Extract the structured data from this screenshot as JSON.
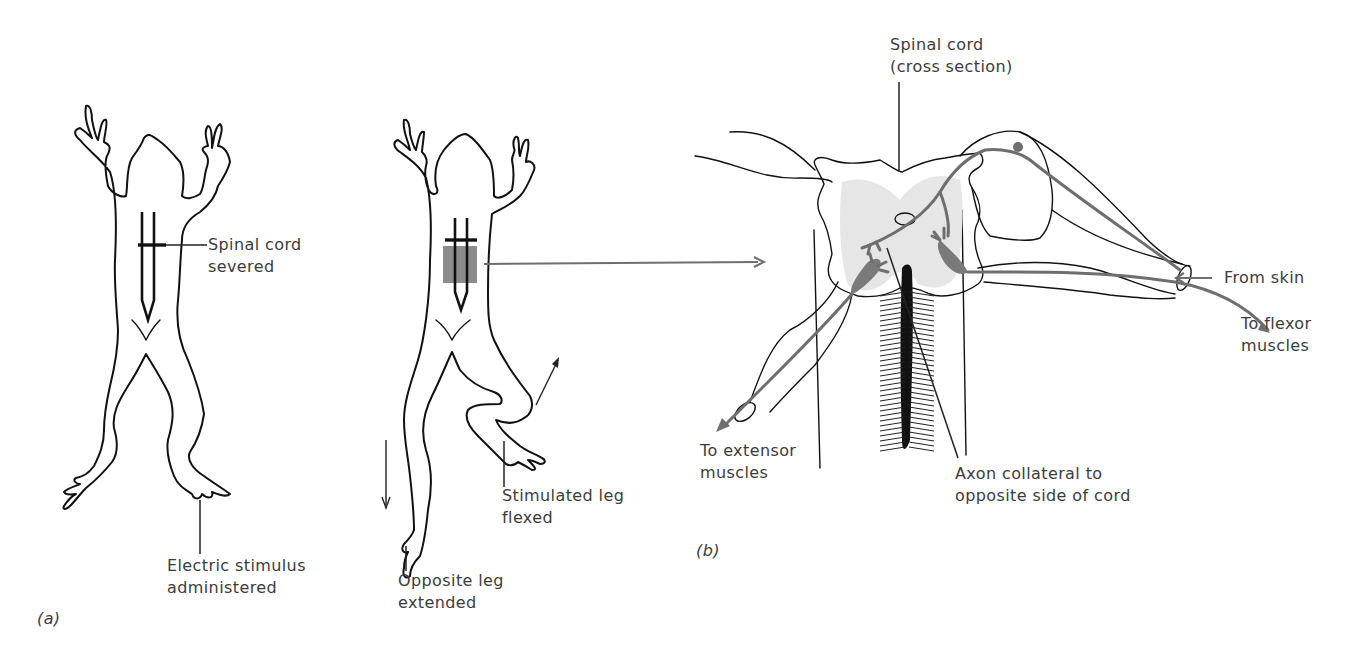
{
  "figure": {
    "panel_a": {
      "label": "(a)",
      "frog1": {
        "annotations": [
          {
            "id": "spinal-cord-severed",
            "lines": [
              "Spinal cord",
              "severed"
            ]
          },
          {
            "id": "electric-stimulus",
            "lines": [
              "Electric stimulus",
              "administered"
            ]
          }
        ]
      },
      "frog2": {
        "annotations": [
          {
            "id": "stimulated-leg",
            "lines": [
              "Stimulated leg",
              "flexed"
            ]
          },
          {
            "id": "opposite-leg",
            "lines": [
              "Opposite leg",
              "extended"
            ]
          }
        ]
      }
    },
    "panel_b": {
      "label": "(b)",
      "annotations": [
        {
          "id": "spinal-cord-cross-section",
          "lines": [
            "Spinal cord",
            "(cross section)"
          ]
        },
        {
          "id": "from-skin",
          "lines": [
            "From skin"
          ]
        },
        {
          "id": "to-flexor",
          "lines": [
            "To flexor",
            "muscles"
          ]
        },
        {
          "id": "to-extensor",
          "lines": [
            "To extensor",
            "muscles"
          ]
        },
        {
          "id": "axon-collateral",
          "lines": [
            "Axon collateral to",
            "opposite side of cord"
          ]
        }
      ]
    },
    "colors": {
      "ink": "#111111",
      "neuron_gray": "#6e6e6e",
      "gray_matter": "#e6e6e6",
      "highlight_box": "#8c8c8c"
    }
  }
}
